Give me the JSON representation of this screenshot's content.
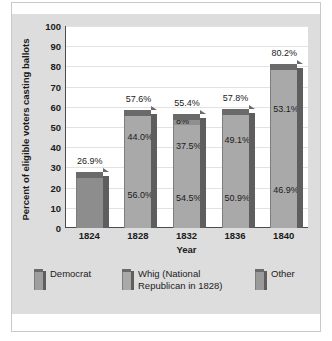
{
  "figure": {
    "top_caption_fragment": "",
    "axis_title_y": "Percent of eligible voters casting ballots",
    "axis_title_x": "Year"
  },
  "chart_data": {
    "type": "bar",
    "subtype": "stacked-bar-3d",
    "title": "",
    "xlabel": "Year",
    "ylabel": "Percent of eligible voters casting ballots",
    "ylim": [
      0,
      100
    ],
    "ytick_step": 10,
    "grid": true,
    "legend_position": "bottom",
    "categories": [
      "1824",
      "1828",
      "1832",
      "1836",
      "1840"
    ],
    "ytick_labels": [
      "0",
      "10",
      "20",
      "30",
      "40",
      "50",
      "60",
      "70",
      "80",
      "90",
      "100"
    ],
    "totals": [
      26.9,
      57.6,
      55.4,
      57.8,
      80.2
    ],
    "total_labels": [
      "26.9%",
      "57.6%",
      "55.4%",
      "57.8%",
      "80.2%"
    ],
    "series": [
      {
        "name": "Democrat",
        "color": "#9a9a9a",
        "share_labels": [
          "",
          "56.0%",
          "54.5%",
          "50.9%",
          "46.9%"
        ],
        "shares": [
          null,
          56.0,
          54.5,
          50.9,
          46.9
        ]
      },
      {
        "name": "Whig (National Republican in 1828)",
        "color": "#adadad",
        "share_labels": [
          "",
          "44.0%",
          "37.5%",
          "49.1%",
          "53.1%"
        ],
        "shares": [
          null,
          44.0,
          37.5,
          49.1,
          53.1
        ]
      },
      {
        "name": "Other",
        "color": "#8f8f8f",
        "share_labels": [
          "",
          "",
          "8%",
          "",
          ""
        ],
        "shares": [
          null,
          null,
          8.0,
          null,
          null
        ]
      }
    ],
    "bars": [
      {
        "year": "1824",
        "total_label": "26.9%",
        "segments": [
          {
            "series": "Democrat",
            "label": "",
            "value": 26.9,
            "color": "#8d8d8d"
          }
        ]
      },
      {
        "year": "1828",
        "total_label": "57.6%",
        "segments": [
          {
            "series": "Democrat",
            "label": "56.0%",
            "value": 56.0,
            "color": "#a9a9a9"
          },
          {
            "series": "Whig (National Republican in 1828)",
            "label": "44.0%",
            "value": 44.0,
            "color": "#a9a9a9"
          }
        ]
      },
      {
        "year": "1832",
        "total_label": "55.4%",
        "segments": [
          {
            "series": "Democrat",
            "label": "54.5%",
            "value": 54.5,
            "color": "#a9a9a9"
          },
          {
            "series": "Whig (National Republican in 1828)",
            "label": "37.5%",
            "value": 37.5,
            "color": "#a9a9a9"
          },
          {
            "series": "Other",
            "label": "8%",
            "value": 8.0,
            "color": "#8f8f8f"
          }
        ]
      },
      {
        "year": "1836",
        "total_label": "57.8%",
        "segments": [
          {
            "series": "Democrat",
            "label": "50.9%",
            "value": 50.9,
            "color": "#a9a9a9"
          },
          {
            "series": "Whig (National Republican in 1828)",
            "label": "49.1%",
            "value": 49.1,
            "color": "#a9a9a9"
          }
        ]
      },
      {
        "year": "1840",
        "total_label": "80.2%",
        "segments": [
          {
            "series": "Democrat",
            "label": "46.9%",
            "value": 46.9,
            "color": "#a9a9a9"
          },
          {
            "series": "Whig (National Republican in 1828)",
            "label": "53.1%",
            "value": 53.1,
            "color": "#a9a9a9"
          }
        ]
      }
    ],
    "legend": [
      {
        "label": "Democrat",
        "color": "#9e9e9e"
      },
      {
        "label": "Whig (National\nRepublican in 1828)",
        "color": "#a9a9a9"
      },
      {
        "label": "Other",
        "color": "#9a9a9a"
      }
    ]
  },
  "colors": {
    "panel_background": "#dddddd",
    "plot_background": "#ffffff",
    "gridline": "#e2e2e2",
    "axis": "#4a4a4a",
    "text": "#1b1b1b",
    "bar_top_cap": "#6a6a6a",
    "bar_side": "#5e5e5e"
  }
}
